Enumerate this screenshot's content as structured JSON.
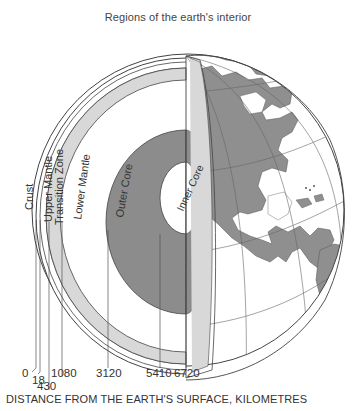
{
  "title": "Regions of the earth's interior",
  "layers": [
    {
      "name": "Crust",
      "depth_km": 0
    },
    {
      "name": "Upper Mantle",
      "depth_km": 18
    },
    {
      "name": "Transition Zone",
      "depth_km": 430
    },
    {
      "name": "Lower Mantle",
      "depth_km": 1080
    },
    {
      "name": "Outer Core",
      "depth_km": 3120
    },
    {
      "name": "Inner Core",
      "depth_km": 5410
    }
  ],
  "labels": {
    "crust": "Crust",
    "upper_mantle": "Upper Mantle",
    "transition_zone": "Transition Zone",
    "lower_mantle": "Lower Mantle",
    "outer_core": "Outer Core",
    "inner_core": "Inner Core"
  },
  "ticks": [
    "0",
    "18",
    "430",
    "1080",
    "3120",
    "5410",
    "6720"
  ],
  "axis_label": "DISTANCE FROM THE EARTH'S SURFACE, KILOMETRES",
  "colors": {
    "core": "#8c8c8c",
    "mantle_band": "#d8d8d8",
    "land": "#8f8f8f",
    "line": "#555555"
  }
}
